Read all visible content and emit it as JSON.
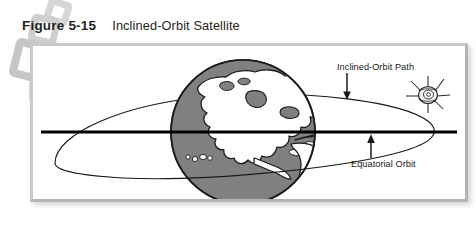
{
  "caption": {
    "figure_label": "Figure 5-15",
    "title": "Inclined-Orbit Satellite"
  },
  "figure": {
    "labels": {
      "inclined_orbit_path": "Inclined-Orbit Path",
      "equatorial_orbit": "Equatorial Orbit"
    },
    "elements": {
      "earth_name": "Earth globe",
      "satellite_name": "Satellite",
      "inclined_orbit_ellipse": "Inclined orbit ellipse",
      "equatorial_orbit_line": "Equatorial orbit line"
    },
    "colors": {
      "earth_fill": "#808080",
      "earth_outline": "#1a1a1a",
      "land_fill": "#ffffff",
      "orbit_stroke": "#1a1a1a",
      "equator_stroke": "#000000",
      "frame_border": "#c9c9c9",
      "watermark": "#d4d4d4",
      "text": "#231f20"
    }
  }
}
